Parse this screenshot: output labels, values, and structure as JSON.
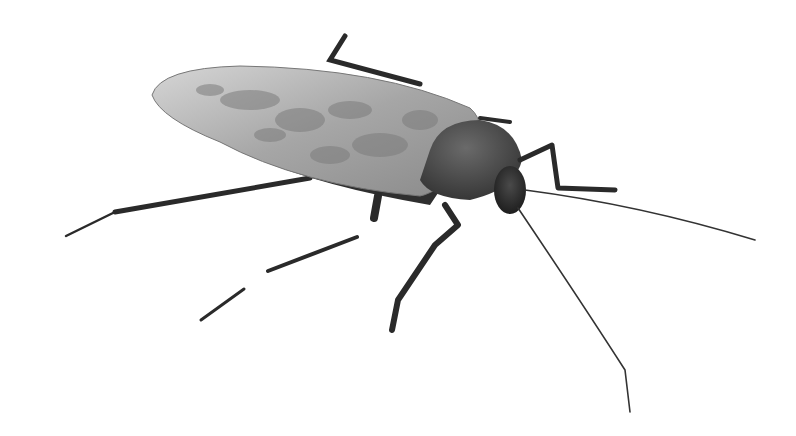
{
  "image": {
    "subject": "cockroach",
    "description": "Grayscale 3D render of a cockroach on a white background",
    "background_color": "#ffffff",
    "colors": {
      "wing_light": "#c8c8c8",
      "wing_mid": "#9a9a9a",
      "wing_dark": "#6e6e6e",
      "pronotum": "#4a4a4a",
      "head": "#2e2e2e",
      "legs": "#2a2a2a",
      "antennae": "#333333"
    }
  }
}
